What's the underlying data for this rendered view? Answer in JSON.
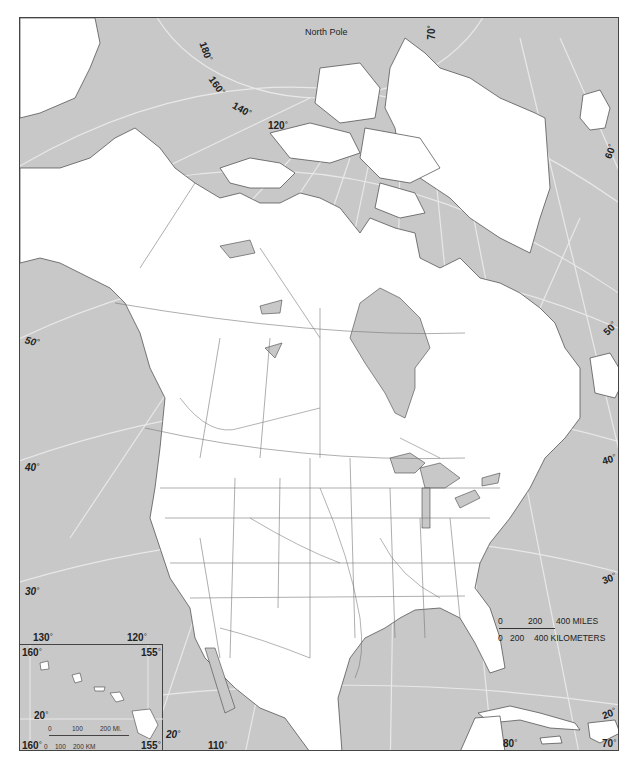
{
  "map": {
    "title": "North America outline map",
    "colors": {
      "water": "#c8c8c8",
      "land": "#ffffff",
      "border": "#555555",
      "graticule": "#e6e6e6",
      "frame": "#444444"
    },
    "pole_label": "North Pole",
    "longitude_labels_top": [
      "180",
      "160",
      "140",
      "120"
    ],
    "right_edge_labels": {
      "lon70": "70",
      "lat60": "60",
      "lat50": "50",
      "lat40": "40",
      "lat30": "30",
      "lat20": "20"
    },
    "left_edge_labels": {
      "lat50": "50",
      "lat40": "40",
      "lat30": "30"
    },
    "bottom_labels": {
      "lon130": "130",
      "lon120": "120",
      "lat20": "20",
      "lon110": "110",
      "lon80": "80",
      "lon70": "70"
    },
    "scale_bar": {
      "miles_ticks": [
        "0",
        "200",
        "400 MILES"
      ],
      "km_ticks": [
        "0",
        "200",
        "400 KILOMETERS"
      ]
    },
    "inset_hawaii": {
      "top_left": "160",
      "top_right": "155",
      "lat_label": "20",
      "bottom_left": "160",
      "bottom_right": "155",
      "scale_miles": [
        "0",
        "100",
        "200 MI."
      ],
      "scale_km": [
        "0",
        "100",
        "200 KM"
      ]
    }
  }
}
